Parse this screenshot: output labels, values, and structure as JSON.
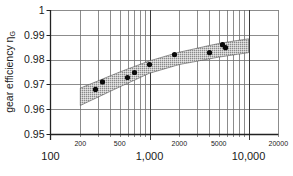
{
  "chart_data": {
    "type": "scatter",
    "title": "",
    "xlabel": "",
    "ylabel": "gear efficiency η",
    "ylabel_subscript": "G",
    "xscale": "log",
    "xlim": [
      100,
      20000
    ],
    "ylim": [
      0.95,
      1.0
    ],
    "grid": true,
    "legend": null,
    "y_ticks": [
      {
        "value": 1.0,
        "label": "1"
      },
      {
        "value": 0.99,
        "label": "0.99"
      },
      {
        "value": 0.98,
        "label": "0.98"
      },
      {
        "value": 0.97,
        "label": "0.97"
      },
      {
        "value": 0.96,
        "label": "0.96"
      },
      {
        "value": 0.95,
        "label": "0.95"
      }
    ],
    "x_major_ticks": [
      {
        "value": 100,
        "label": "100"
      },
      {
        "value": 1000,
        "label": "1,000"
      },
      {
        "value": 10000,
        "label": "10,000"
      }
    ],
    "x_minor_labels": [
      {
        "value": 200,
        "label": "200"
      },
      {
        "value": 500,
        "label": "500"
      },
      {
        "value": 2000,
        "label": "2000"
      },
      {
        "value": 5000,
        "label": "5000"
      },
      {
        "value": 20000,
        "label": "20000"
      }
    ],
    "x_gridlines": [
      200,
      300,
      400,
      500,
      600,
      700,
      800,
      900,
      1000,
      2000,
      3000,
      4000,
      5000,
      6000,
      7000,
      8000,
      9000,
      10000,
      20000
    ],
    "series": [
      {
        "name": "measured points",
        "kind": "scatter",
        "points": [
          {
            "x": 285,
            "y": 0.968
          },
          {
            "x": 335,
            "y": 0.971
          },
          {
            "x": 600,
            "y": 0.9728
          },
          {
            "x": 705,
            "y": 0.9748
          },
          {
            "x": 1000,
            "y": 0.978
          },
          {
            "x": 1790,
            "y": 0.982
          },
          {
            "x": 4035,
            "y": 0.9828
          },
          {
            "x": 5460,
            "y": 0.986
          },
          {
            "x": 5860,
            "y": 0.9848
          }
        ]
      },
      {
        "name": "scatter band",
        "kind": "band",
        "upper": [
          {
            "x": 200,
            "y": 0.9685
          },
          {
            "x": 500,
            "y": 0.975
          },
          {
            "x": 1000,
            "y": 0.9795
          },
          {
            "x": 2000,
            "y": 0.983
          },
          {
            "x": 5000,
            "y": 0.9865
          },
          {
            "x": 10000,
            "y": 0.9884
          }
        ],
        "lower": [
          {
            "x": 200,
            "y": 0.9615
          },
          {
            "x": 500,
            "y": 0.969
          },
          {
            "x": 1000,
            "y": 0.9745
          },
          {
            "x": 2000,
            "y": 0.978
          },
          {
            "x": 5000,
            "y": 0.981
          },
          {
            "x": 10000,
            "y": 0.9828
          }
        ]
      }
    ]
  }
}
